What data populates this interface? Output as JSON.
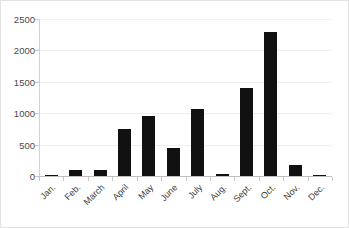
{
  "chart_data": {
    "type": "bar",
    "title": "",
    "subtitle": "",
    "xlabel": "",
    "ylabel": "",
    "categories": [
      "Jan.",
      "Feb.",
      "March",
      "April",
      "May",
      "June",
      "July",
      "Aug.",
      "Sept.",
      "Oct.",
      "Nov.",
      "Dec."
    ],
    "values": [
      20,
      90,
      100,
      750,
      950,
      450,
      1060,
      30,
      1400,
      2300,
      180,
      20
    ],
    "ylim": [
      0,
      2500
    ],
    "y_ticks": [
      0,
      500,
      1000,
      1500,
      2000,
      2500
    ],
    "y_tick_labels": [
      "0",
      "500",
      "1000",
      "1500",
      "2000",
      "2500"
    ],
    "grid": true,
    "legend": false,
    "legend_position": "none",
    "bar_color": "#111111",
    "gridline_color": "#efefef",
    "axis_color": "#bdbdbd",
    "background_color": "#ffffff",
    "border_color": "#e3e3e3"
  }
}
